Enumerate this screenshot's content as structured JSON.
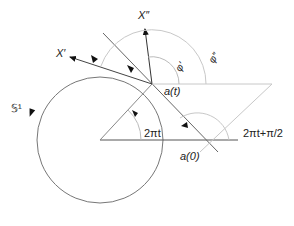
{
  "diagram": {
    "labels": {
      "x_double_prime": "X″",
      "x_prime": "X′",
      "phi_prime": "φ′",
      "phi_double_prime": "φ″",
      "a_t": "a(t)",
      "a_0": "a(0)",
      "two_pi_t": "2πt",
      "two_pi_t_plus_half_pi": "2πt+π/2",
      "s1": "𝕊¹"
    },
    "colors": {
      "stroke_dark": "#333333",
      "stroke_mid": "#777777",
      "stroke_light": "#c8c8c8",
      "text": "#222222"
    }
  }
}
